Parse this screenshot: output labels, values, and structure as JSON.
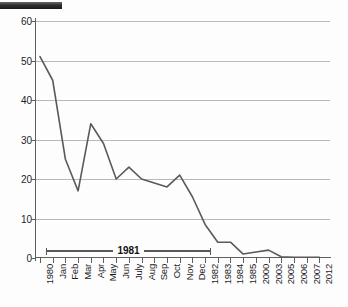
{
  "chart_data": {
    "type": "line",
    "title": "",
    "subtitle": "",
    "xlabel": "",
    "ylabel": "",
    "ylim": [
      0,
      60
    ],
    "yticks": [
      0,
      10,
      20,
      30,
      40,
      50,
      60
    ],
    "grid": true,
    "legend": "none",
    "categories": [
      "1980",
      "Jan",
      "Feb",
      "Mar",
      "Apr",
      "May",
      "Jun",
      "July",
      "Aug",
      "Sep",
      "Oct",
      "Nov",
      "Dec",
      "1982",
      "1983",
      "1984",
      "1985",
      "2000",
      "2003",
      "2005",
      "2006",
      "2007",
      "2012"
    ],
    "values": [
      51,
      45,
      25,
      17,
      34,
      29,
      20,
      23,
      20,
      19,
      18,
      21,
      15.5,
      8.5,
      4,
      4,
      1,
      1.5,
      2,
      0.3,
      0.2,
      0.2,
      0.2
    ],
    "series": [
      {
        "name": "value",
        "values": [
          51,
          45,
          25,
          17,
          34,
          29,
          20,
          23,
          20,
          19,
          18,
          21,
          15.5,
          8.5,
          4,
          4,
          1,
          1.5,
          2,
          0.3,
          0.2,
          0.2,
          0.2
        ]
      }
    ],
    "annotations": [
      {
        "label": "1981",
        "kind": "span-bracket",
        "from_category": "Jan",
        "to_category": "Dec",
        "y": 3
      }
    ],
    "colors": {
      "line": "#5a5a5a",
      "grid": "#b9b9b9",
      "axis": "#5e5e5e",
      "text": "#1d1d1d",
      "background": "#fdfdfd",
      "topbar": "#2e2e2e"
    }
  },
  "ylabels": [
    "60",
    "50",
    "40",
    "30",
    "20",
    "10",
    "0"
  ],
  "annotation": {
    "label": "1981"
  }
}
